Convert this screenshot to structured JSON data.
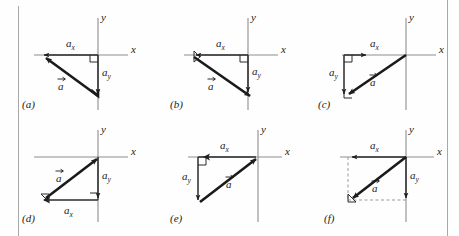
{
  "figure": {
    "top_partial_text": "",
    "background_color": "#fefefe",
    "axis_color": "#8d8d8d",
    "vector_color": "#1a1a1a",
    "component_color": "#2b2b2b",
    "dashed_color": "#9a9a9a",
    "rule_color": "#a8a8a8"
  },
  "labels": {
    "x_axis": "x",
    "y_axis": "y",
    "vector": "a",
    "comp_x_base": "a",
    "comp_x_sub": "x",
    "comp_y_base": "a",
    "comp_y_sub": "y"
  },
  "panels": [
    {
      "id": "a",
      "tag": "(a)",
      "quadrant": "III",
      "description": "Vector a points down-left from origin region; a_x points left along negative x, a_y points down from x-axis to vector tail",
      "ax_sign": "negative",
      "ay_sign": "negative",
      "arrow_origin": "tail-at-vector-tip-lower-right",
      "vector_tip": "upper-left"
    },
    {
      "id": "b",
      "tag": "(b)",
      "quadrant": "III",
      "description": "Vector a points down-right toward lower right; a_x points left along negative x, a_y points down",
      "ax_sign": "negative",
      "ay_sign": "negative",
      "vector_tip": "lower-right"
    },
    {
      "id": "c",
      "tag": "(c)",
      "quadrant": "III",
      "description": "Vector a points down-left from origin on x-axis to lower-left; a_x points right, a_y points down",
      "ax_sign": "positive",
      "ay_sign": "negative",
      "vector_tip": "lower-left"
    },
    {
      "id": "d",
      "tag": "(d)",
      "quadrant": "III",
      "description": "Vector a points up-right to origin; a_x points right along the bottom, a_y points down from origin",
      "ax_sign": "positive",
      "ay_sign": "negative",
      "vector_tip": "upper-right"
    },
    {
      "id": "e",
      "tag": "(e)",
      "quadrant": "III",
      "description": "Vector a points up-right to origin; a_x points right along x-axis, a_y points down on the left",
      "ax_sign": "positive",
      "ay_sign": "negative",
      "vector_tip": "upper-right"
    },
    {
      "id": "f",
      "tag": "(f)",
      "quadrant": "III",
      "description": "Vector a points down-left from origin; a_x points left along x-axis, a_y points down; dashed construction rectangle",
      "ax_sign": "negative",
      "ay_sign": "negative",
      "vector_tip": "lower-left",
      "has_dashed_construction": true
    }
  ]
}
